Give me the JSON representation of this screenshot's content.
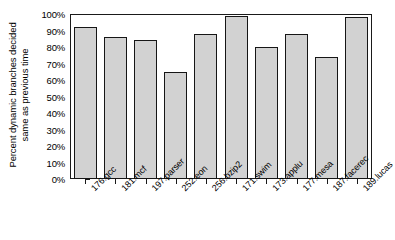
{
  "chart_data": {
    "type": "bar",
    "title": "",
    "xlabel": "",
    "ylabel": "Percent dynamic branches decided same as previous time",
    "ylabel_lines": [
      "Percent dynamic branches decided",
      "same as previous time"
    ],
    "ylim": [
      0,
      100
    ],
    "ytick_labels": [
      "100%",
      "90%",
      "80%",
      "70%",
      "60%",
      "50%",
      "40%",
      "30%",
      "20%",
      "10%",
      "0%"
    ],
    "ytick_values": [
      100,
      90,
      80,
      70,
      60,
      50,
      40,
      30,
      20,
      10,
      0
    ],
    "grid": false,
    "legend": false,
    "categories": [
      "176.gcc",
      "181.mcf",
      "197.parser",
      "252.eon",
      "256.bzip2",
      "171.swim",
      "173.applu",
      "177.mesa",
      "187.facerec",
      "189.lucas"
    ],
    "values": [
      92,
      86,
      84,
      65,
      88,
      99,
      80,
      88,
      74,
      98
    ],
    "bar_fill_color": "#d2d2d2",
    "bar_border_color": "#161616",
    "axis_color": "#1a1a1a",
    "background_color": "#ffffff"
  }
}
